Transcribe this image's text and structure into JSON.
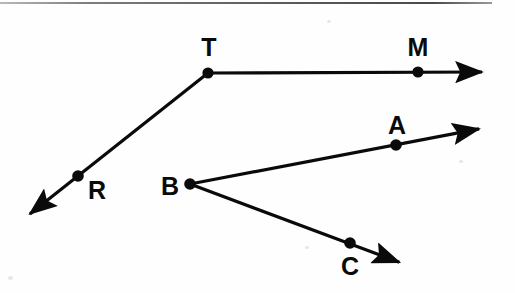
{
  "figure": {
    "background_color": "#fefefe",
    "stroke_color": "#0a0a0a",
    "width": 515,
    "height": 293
  },
  "labels": {
    "T": "T",
    "M": "M",
    "R": "R",
    "B": "B",
    "A": "A",
    "C": "C"
  },
  "chart_data": {
    "type": "scatter",
    "xlabel": "",
    "ylabel": "",
    "xlim": [
      0,
      515
    ],
    "ylim": [
      293,
      0
    ],
    "grid": false,
    "legend": "none",
    "points": [
      {
        "name": "T",
        "x": 208,
        "y": 73,
        "label_x": 209,
        "label_y": 47,
        "role": "vertex"
      },
      {
        "name": "M",
        "x": 418,
        "y": 72,
        "label_x": 418,
        "label_y": 47,
        "role": "point-on-ray"
      },
      {
        "name": "R",
        "x": 78,
        "y": 176,
        "label_x": 97,
        "label_y": 190,
        "role": "point-on-ray"
      },
      {
        "name": "B",
        "x": 190,
        "y": 184,
        "label_x": 170,
        "label_y": 186,
        "role": "vertex"
      },
      {
        "name": "A",
        "x": 396,
        "y": 145,
        "label_x": 397,
        "label_y": 125,
        "role": "point-on-ray"
      },
      {
        "name": "C",
        "x": 350,
        "y": 243,
        "label_x": 350,
        "label_y": 266,
        "role": "point-on-ray"
      }
    ],
    "rays": [
      {
        "name": "ray-TM",
        "from": "T",
        "through": "M",
        "x1": 208,
        "y1": 73,
        "x2": 487,
        "y2": 72,
        "arrow_at_end": true
      },
      {
        "name": "ray-TR",
        "from": "T",
        "through": "R",
        "x1": 208,
        "y1": 73,
        "x2": 26,
        "y2": 217,
        "arrow_at_end": true
      },
      {
        "name": "ray-BA",
        "from": "B",
        "through": "A",
        "x1": 190,
        "y1": 184,
        "x2": 484,
        "y2": 128,
        "arrow_at_end": true
      },
      {
        "name": "ray-BC",
        "from": "B",
        "through": "C",
        "x1": 190,
        "y1": 184,
        "x2": 404,
        "y2": 264,
        "arrow_at_end": true
      }
    ],
    "angles": [
      {
        "name": "angle-RTM",
        "vertex": "T",
        "sides": [
          "R",
          "M"
        ]
      },
      {
        "name": "angle-ABC",
        "vertex": "B",
        "sides": [
          "A",
          "C"
        ]
      }
    ]
  }
}
